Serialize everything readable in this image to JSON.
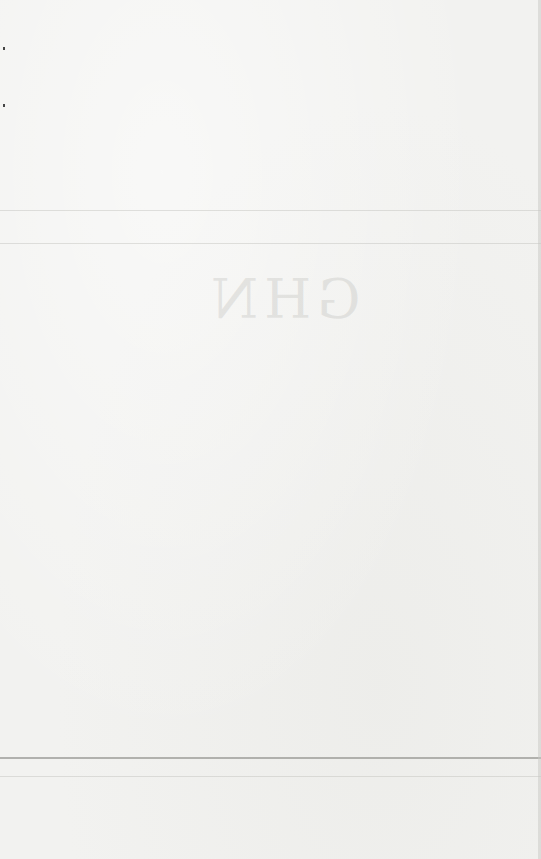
{
  "page": {
    "type": "blank scanned page",
    "background_color": "#f2f2f0",
    "show_through_text": [
      "GHN"
    ],
    "rules": [
      {
        "y": 210,
        "style": "faint"
      },
      {
        "y": 243,
        "style": "faint"
      },
      {
        "y": 757,
        "style": "strong"
      },
      {
        "y": 776,
        "style": "faint"
      }
    ],
    "margin_marks": [
      {
        "x": 3,
        "y": 47
      },
      {
        "x": 3,
        "y": 104
      }
    ]
  }
}
